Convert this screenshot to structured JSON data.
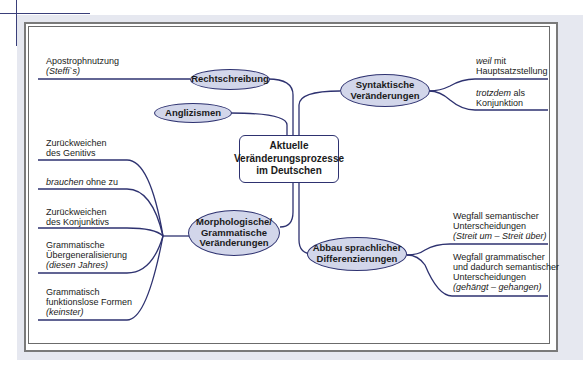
{
  "diagram": {
    "type": "mind-map",
    "center": {
      "lines": [
        "Aktuelle",
        "Veränderungsprozesse",
        "im Deutschen"
      ]
    },
    "branches": [
      {
        "id": "rechtschreibung",
        "label": "Rechtschreibung",
        "leaves": [
          {
            "lines": [
              "Apostrophnutzung"
            ],
            "example": "(Steffi`s)"
          }
        ]
      },
      {
        "id": "anglizismen",
        "label": "Anglizismen",
        "leaves": []
      },
      {
        "id": "syntaktische",
        "label_lines": [
          "Syntaktische",
          "Veränderungen"
        ],
        "leaves": [
          {
            "italic": "weil",
            "rest": " mit",
            "line2": "Hauptsatzstellung"
          },
          {
            "italic": "trotzdem",
            "rest": " als",
            "line2": "Konjunktion"
          }
        ]
      },
      {
        "id": "morphologische",
        "label_lines": [
          "Morphologische/",
          "Grammatische",
          "Veränderungen"
        ],
        "leaves": [
          {
            "lines": [
              "Zurückweichen",
              "des Genitivs"
            ]
          },
          {
            "italic": "brauchen",
            "rest": " ohne zu"
          },
          {
            "lines": [
              "Zurückweichen",
              "des Konjunktivs"
            ]
          },
          {
            "lines": [
              "Grammatische",
              "Übergeneralisierung"
            ],
            "example": "(diesen Jahres)"
          },
          {
            "lines": [
              "Grammatisch",
              "funktionslose Formen"
            ],
            "example": "(keinster)"
          }
        ]
      },
      {
        "id": "abbau",
        "label_lines": [
          "Abbau sprachlicher",
          "Differenzierungen"
        ],
        "leaves": [
          {
            "lines": [
              "Wegfall semantischer",
              "Unterscheidungen"
            ],
            "example": "(Streit um – Streit über)"
          },
          {
            "lines": [
              "Wegfall grammatischer",
              "und dadurch semantischer",
              "Unterscheidungen"
            ],
            "example": "(gehängt – gehangen)"
          }
        ]
      }
    ],
    "colors": {
      "line": "#2e3270",
      "node_fill": "#d2d6ea",
      "frame": "#7a7a7a",
      "outer_bg": "#e6e8f0"
    }
  }
}
